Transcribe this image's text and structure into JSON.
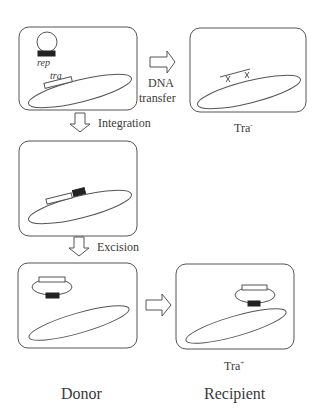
{
  "figure": {
    "panels": [
      {
        "id": "donor-initial",
        "plasmid_gene": "rep",
        "chromosome_gene": "tra"
      },
      {
        "id": "recipient-transfer",
        "phenotype": "Tra",
        "phenotype_sign": "-"
      },
      {
        "id": "donor-integrated"
      },
      {
        "id": "donor-excised"
      },
      {
        "id": "recipient-final",
        "phenotype": "Tra",
        "phenotype_sign": "+"
      }
    ],
    "arrows": {
      "dna_transfer": {
        "line1": "DNA",
        "line2": "transfer"
      },
      "integration": "Integration",
      "excision": "Excision"
    },
    "column_labels": {
      "donor": "Donor",
      "recipient": "Recipient"
    }
  }
}
